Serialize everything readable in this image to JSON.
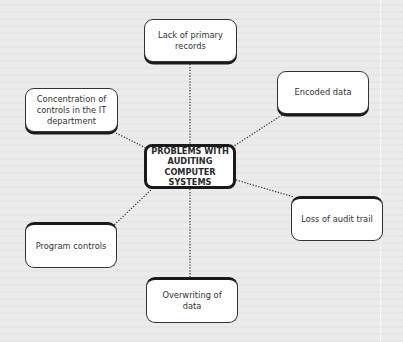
{
  "diagram": {
    "type": "mind-map",
    "center": {
      "label": "PROBLEMS WITH AUDITING COMPUTER SYSTEMS",
      "lines": [
        "PROBLEMS WITH",
        "AUDITING",
        "COMPUTER SYSTEMS"
      ]
    },
    "nodes": [
      {
        "id": "lack",
        "label": "Lack of primary records",
        "lines": [
          "Lack of primary",
          "records"
        ]
      },
      {
        "id": "concentration",
        "label": "Concentration of controls in the IT department",
        "lines": [
          "Concentration of",
          "controls in the IT",
          "department"
        ]
      },
      {
        "id": "encoded",
        "label": "Encoded data",
        "lines": [
          "Encoded data"
        ]
      },
      {
        "id": "loss",
        "label": "Loss of audit trail",
        "lines": [
          "Loss of audit trail"
        ]
      },
      {
        "id": "program",
        "label": "Program controls",
        "lines": [
          "Program controls"
        ]
      },
      {
        "id": "overwriting",
        "label": "Overwriting of data",
        "lines": [
          "Overwriting of data"
        ]
      }
    ],
    "edges": [
      {
        "from": "center",
        "to": "lack",
        "style": "dotted"
      },
      {
        "from": "center",
        "to": "concentration",
        "style": "dotted"
      },
      {
        "from": "center",
        "to": "encoded",
        "style": "dotted"
      },
      {
        "from": "center",
        "to": "loss",
        "style": "dotted"
      },
      {
        "from": "center",
        "to": "program",
        "style": "dotted"
      },
      {
        "from": "center",
        "to": "overwriting",
        "style": "dotted"
      }
    ],
    "colors": {
      "background": "#ebebeb",
      "node_fill": "#ffffff",
      "border": "#1a1a1a"
    }
  }
}
